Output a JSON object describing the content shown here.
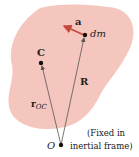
{
  "diagram": {
    "body_color": "#f4c6be",
    "vector_color": "#555555",
    "accel_color": "#c8463a",
    "labels": {
      "acceleration": "a",
      "mass_element": "dm",
      "center_of_mass": "C",
      "position_R": "R",
      "position_rOC_main": "r",
      "position_rOC_sub": "OC",
      "origin": "O",
      "frame_note_line1": "(Fixed in",
      "frame_note_line2": "inertial frame)"
    }
  }
}
